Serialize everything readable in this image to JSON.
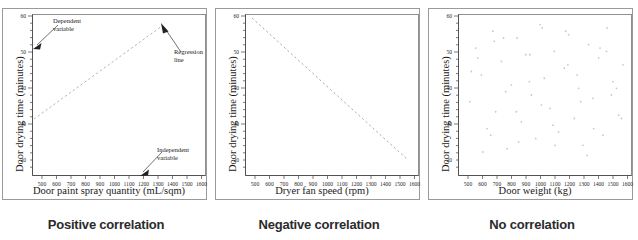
{
  "figure": {
    "shared_ylabel": "Door drying time (minutes)",
    "y_ticks": [
      20,
      30,
      40,
      50,
      60
    ],
    "x_ticks": [
      500,
      600,
      700,
      800,
      900,
      1000,
      1100,
      1200,
      1300,
      1400,
      1500,
      1600
    ],
    "colors": {
      "frame": "#9a9a9a",
      "axis": "#3a3a3a",
      "line": "#8c8c8c",
      "point": "#c8c8c8",
      "caption": "#2b2b2b",
      "annotation": "#222222"
    }
  },
  "panels": [
    {
      "id": "positive",
      "caption": "Positive correlation",
      "xlabel": "Door paint spray quantity (mL/sqm)",
      "ylabel": "Door drying time (minutes)",
      "annotations": [
        {
          "name": "dependent-variable",
          "lines": [
            "Dependent",
            "variable"
          ]
        },
        {
          "name": "regression-line",
          "lines": [
            "Regression",
            "line"
          ]
        },
        {
          "name": "independent-variable",
          "lines": [
            "Independent",
            "variable"
          ]
        }
      ]
    },
    {
      "id": "negative",
      "caption": "Negative correlation",
      "xlabel": "Dryer fan speed (rpm)",
      "ylabel": "Door drying time (minutes)",
      "annotations": []
    },
    {
      "id": "none",
      "caption": "No correlation",
      "xlabel": "Door weight (kg)",
      "ylabel": "Door drying time (minutes)",
      "annotations": []
    }
  ],
  "chart_data": [
    {
      "type": "line",
      "title": "Positive correlation",
      "xlabel": "Door paint spray quantity (mL/sqm)",
      "ylabel": "Door drying time (minutes)",
      "xlim": [
        440,
        1650
      ],
      "ylim": [
        14,
        62
      ],
      "xticks": [
        500,
        600,
        700,
        800,
        900,
        1000,
        1100,
        1200,
        1300,
        1400,
        1500,
        1600
      ],
      "yticks": [
        20,
        30,
        40,
        50,
        60
      ],
      "grid": false,
      "legend": "none",
      "series": [
        {
          "name": "Regression line",
          "style": "dashed",
          "x": [
            460,
            1360
          ],
          "y": [
            30,
            57.5
          ]
        }
      ],
      "annotations": [
        {
          "text": "Dependent variable",
          "points_to": "y-axis"
        },
        {
          "text": "Regression line",
          "points_to": "regression-line-upper-end"
        },
        {
          "text": "Independent variable",
          "points_to": "x-axis"
        }
      ]
    },
    {
      "type": "line",
      "title": "Negative correlation",
      "xlabel": "Dryer fan speed (rpm)",
      "ylabel": "Door drying time (minutes)",
      "xlim": [
        440,
        1650
      ],
      "ylim": [
        14,
        62
      ],
      "xticks": [
        500,
        600,
        700,
        800,
        900,
        1000,
        1100,
        1200,
        1300,
        1400,
        1500,
        1600
      ],
      "yticks": [
        20,
        30,
        40,
        50,
        60
      ],
      "grid": false,
      "legend": "none",
      "series": [
        {
          "name": "Regression line",
          "style": "dashed",
          "x": [
            490,
            1580
          ],
          "y": [
            60,
            20
          ]
        }
      ],
      "annotations": []
    },
    {
      "type": "scatter",
      "title": "No correlation",
      "xlabel": "Door weight (kg)",
      "ylabel": "Door drying time (minutes)",
      "xlim": [
        440,
        1650
      ],
      "ylim": [
        14,
        62
      ],
      "xticks": [
        500,
        600,
        700,
        800,
        900,
        1000,
        1100,
        1200,
        1300,
        1400,
        1500,
        1600
      ],
      "yticks": [
        20,
        30,
        40,
        50,
        60
      ],
      "grid": false,
      "legend": "none",
      "series": [
        {
          "name": "Observations",
          "x": [
            520,
            560,
            600,
            640,
            680,
            700,
            740,
            780,
            810,
            850,
            880,
            910,
            950,
            980,
            1010,
            1040,
            1080,
            1110,
            1140,
            1180,
            1210,
            1250,
            1280,
            1310,
            1350,
            1380,
            1420,
            1450,
            1480,
            1520,
            1560,
            1590,
            530,
            610,
            690,
            770,
            860,
            940,
            1020,
            1100,
            1190,
            1270,
            1340,
            1430,
            1510,
            1580,
            575,
            665,
            755,
            845,
            935,
            1025,
            1115,
            1205,
            1295,
            1385,
            1475,
            1545
          ],
          "y": [
            36,
            52,
            44,
            28,
            57,
            33,
            48,
            22,
            41,
            55,
            30,
            50,
            38,
            25,
            59,
            43,
            34,
            51,
            27,
            46,
            56,
            31,
            40,
            23,
            53,
            37,
            49,
            26,
            58,
            42,
            32,
            47,
            45,
            21,
            54,
            39,
            24,
            50,
            35,
            29,
            57,
            44,
            20,
            52,
            38,
            31,
            49,
            26,
            55,
            33,
            42,
            58,
            23,
            47,
            36,
            28,
            51,
            40
          ]
        }
      ],
      "annotations": []
    }
  ]
}
